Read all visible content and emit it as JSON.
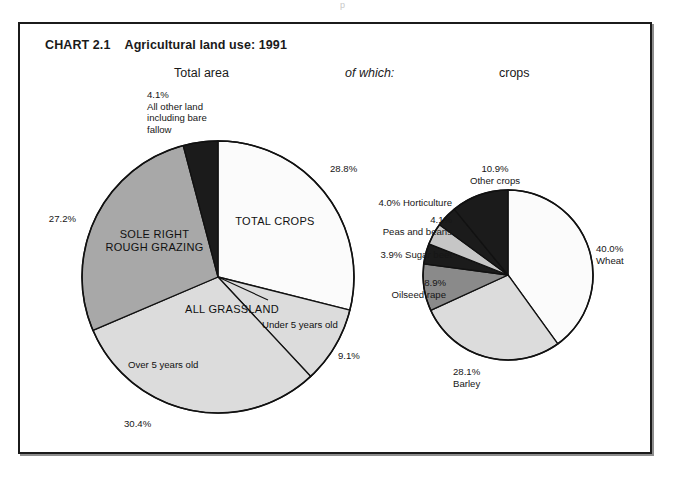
{
  "artifact": {
    "text": "p"
  },
  "chart": {
    "number": "CHART 2.1",
    "title": "Agricultural land use: 1991",
    "headers": {
      "total_area": "Total area",
      "of_which": "of which:",
      "crops": "crops"
    }
  },
  "colors": {
    "white": "#ffffff",
    "very_light_gray": "#fbfbfb",
    "light_gray": "#dcdcdc",
    "mid_gray": "#a8a8a8",
    "dark_gray": "#8a8a8a",
    "black": "#1b1b1b",
    "outline": "#111111"
  },
  "chart_data": [
    {
      "type": "pie",
      "name": "total-area",
      "title": "Total area",
      "start_angle_deg": 0,
      "direction": "clockwise",
      "radius": 136,
      "center": [
        218,
        277
      ],
      "slices": [
        {
          "label": "TOTAL CROPS",
          "value": 28.8,
          "value_label": "28.8%",
          "fill": "#fbfbfb",
          "inside_label": "TOTAL CROPS",
          "inside_label_pos": [
            268,
            223
          ],
          "outside_label_pos": [
            330,
            165
          ],
          "outside_label_align": "left"
        },
        {
          "label": "Under 5 years old",
          "value": 9.1,
          "value_label": "9.1%",
          "fill": "#dcdcdc",
          "inside_label": "Under 5 years old",
          "inside_label_pos": [
            267,
            320
          ],
          "outside_label_pos": [
            340,
            353
          ],
          "outside_label_align": "left"
        },
        {
          "label": "Over 5 years old",
          "value": 30.4,
          "value_label": "30.4%",
          "fill": "#dcdcdc",
          "inside_label": "Over 5 years old",
          "inside_label_pos": [
            177,
            363
          ],
          "outside_label_pos": [
            150,
            421
          ],
          "outside_label_align": "center"
        },
        {
          "label": "SOLE RIGHT ROUGH GRAZING",
          "value": 27.2,
          "value_label": "27.2%",
          "fill": "#a8a8a8",
          "inside_label": "SOLE RIGHT\nROUGH GRAZING",
          "inside_label_pos": [
            152,
            238
          ],
          "outside_label_pos": [
            52,
            216
          ],
          "outside_label_align": "right"
        },
        {
          "label": "All other land including bare fallow",
          "value": 4.1,
          "value_label": "4.1%",
          "fill": "#1b1b1b",
          "inside_label": "",
          "outside_label_pos": [
            147,
            92
          ],
          "outside_label_align": "left"
        }
      ],
      "group_label": {
        "text": "ALL GRASSLAND",
        "pos": [
          230,
          310
        ]
      },
      "annotations": [
        {
          "text": "4.1%",
          "pos": [
            147,
            92
          ]
        },
        {
          "text": "All other land",
          "pos": [
            147,
            103
          ]
        },
        {
          "text": "including bare",
          "pos": [
            147,
            114
          ]
        },
        {
          "text": "fallow",
          "pos": [
            147,
            125
          ]
        }
      ]
    },
    {
      "type": "pie",
      "name": "crops",
      "title": "crops",
      "start_angle_deg": 0,
      "direction": "clockwise",
      "radius": 85,
      "center": [
        508,
        275
      ],
      "slices": [
        {
          "label": "Wheat",
          "value": 40.0,
          "value_label": "40.0%",
          "fill": "#fbfbfb",
          "outside_label_pos": [
            597,
            245
          ],
          "outside_label_align": "left"
        },
        {
          "label": "Barley",
          "value": 28.1,
          "value_label": "28.1%",
          "fill": "#dcdcdc",
          "outside_label_pos": [
            455,
            372
          ],
          "outside_label_align": "left"
        },
        {
          "label": "Oilseed rape",
          "value": 8.9,
          "value_label": "8.9%",
          "fill": "#8a8a8a",
          "outside_label_pos": [
            428,
            285
          ],
          "outside_label_align": "right"
        },
        {
          "label": "Sugar beet",
          "value": 3.9,
          "value_label": "3.9%",
          "fill": "#1b1b1b",
          "outside_label_pos": [
            439,
            258
          ],
          "outside_label_align": "right"
        },
        {
          "label": "Peas and beans",
          "value": 4.1,
          "value_label": "4.1%",
          "fill": "#c6c6c6",
          "outside_label_pos": [
            438,
            222
          ],
          "outside_label_align": "right"
        },
        {
          "label": "Horticulture",
          "value": 4.0,
          "value_label": "4.0%",
          "fill": "#1b1b1b",
          "outside_label_pos": [
            442,
            203
          ],
          "outside_label_align": "right"
        },
        {
          "label": "Other crops",
          "value": 10.9,
          "value_label": "10.9%",
          "fill": "#1b1b1b",
          "outside_label_pos": [
            487,
            166
          ],
          "outside_label_align": "left"
        }
      ],
      "annotations": [
        {
          "text": "10.9%",
          "pos": [
            487,
            166
          ]
        },
        {
          "text": "Other crops",
          "pos": [
            481,
            178
          ]
        },
        {
          "text": "4.0% Horticulture",
          "pos": [
            380,
            200
          ]
        },
        {
          "text": "4.1%",
          "pos": [
            413,
            217
          ]
        },
        {
          "text": "Peas and beans",
          "pos": [
            384,
            228
          ]
        },
        {
          "text": "3.9% Sugar beet",
          "pos": [
            384,
            253
          ]
        },
        {
          "text": "8.9%",
          "pos": [
            397,
            281
          ]
        },
        {
          "text": "Oilseed rape",
          "pos": [
            378,
            292
          ]
        },
        {
          "text": "40.0%",
          "pos": [
            597,
            246
          ]
        },
        {
          "text": "Wheat",
          "pos": [
            597,
            257
          ]
        },
        {
          "text": "28.1%",
          "pos": [
            455,
            369
          ]
        },
        {
          "text": "Barley",
          "pos": [
            455,
            380
          ]
        }
      ]
    }
  ],
  "labels": {
    "left_pie": {
      "pct_crops": "28.8%",
      "pct_under5": "9.1%",
      "pct_over5": "30.4%",
      "pct_grazing": "27.2%",
      "other_pct": "4.1%",
      "other_l1": "All other land",
      "other_l2": "including bare",
      "other_l3": "fallow",
      "total_crops": "TOTAL CROPS",
      "all_grassland": "ALL GRASSLAND",
      "under5": "Under 5 years old",
      "over5": "Over 5 years old",
      "sole_right_1": "SOLE RIGHT",
      "sole_right_2": "ROUGH GRAZING"
    },
    "right_pie": {
      "other_crops_pct": "10.9%",
      "other_crops": "Other crops",
      "horticulture": "4.0% Horticulture",
      "peas_pct": "4.1%",
      "peas": "Peas and beans",
      "sugar_beet": "3.9% Sugar beet",
      "oilseed_pct": "8.9%",
      "oilseed": "Oilseed rape",
      "wheat_pct": "40.0%",
      "wheat": "Wheat",
      "barley_pct": "28.1%",
      "barley": "Barley"
    }
  }
}
